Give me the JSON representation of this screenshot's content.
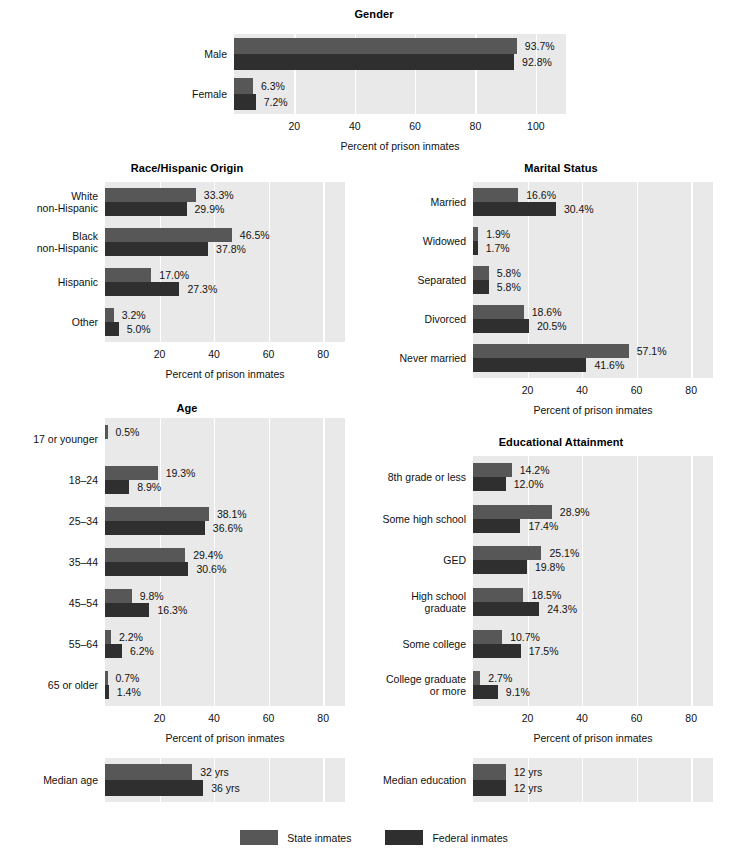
{
  "figure": {
    "bar_colors": {
      "state": "#575757",
      "federal": "#2f2f2f"
    },
    "plot_background": "#e9e9e9",
    "gridline_color": "#ffffff",
    "axis_title": "Percent of prison inmates"
  },
  "legend": {
    "items": [
      {
        "label": "State inmates",
        "color": "#575757",
        "key": "state"
      },
      {
        "label": "Federal inmates",
        "color": "#2f2f2f",
        "key": "federal"
      }
    ]
  },
  "chart_data": [
    {
      "id": "gender",
      "type": "bar",
      "orientation": "horizontal",
      "title": "Gender",
      "xlabel": "Percent of prison inmates",
      "ylabel": "",
      "xlim": [
        0,
        110
      ],
      "ticks": [
        20,
        40,
        60,
        80,
        100
      ],
      "tick_labels": [
        "20",
        "40",
        "60",
        "80",
        "100"
      ],
      "grid": true,
      "legend_position": "figure-bottom-center",
      "categories": [
        "Male",
        "Female"
      ],
      "series": [
        {
          "name": "State inmates",
          "values": [
            93.7,
            6.3
          ],
          "labels": [
            "93.7%",
            "6.3%"
          ]
        },
        {
          "name": "Federal inmates",
          "values": [
            92.8,
            7.2
          ],
          "labels": [
            "92.8%",
            "7.2%"
          ]
        }
      ]
    },
    {
      "id": "race",
      "type": "bar",
      "orientation": "horizontal",
      "title": "Race/Hispanic Origin",
      "xlabel": "Percent of prison inmates",
      "ylabel": "",
      "xlim": [
        0,
        88
      ],
      "ticks": [
        20,
        40,
        60,
        80
      ],
      "tick_labels": [
        "20",
        "40",
        "60",
        "80"
      ],
      "grid": true,
      "categories": [
        "White\nnon-Hispanic",
        "Black\nnon-Hispanic",
        "Hispanic",
        "Other"
      ],
      "series": [
        {
          "name": "State inmates",
          "values": [
            33.3,
            46.5,
            17.0,
            3.2
          ],
          "labels": [
            "33.3%",
            "46.5%",
            "17.0%",
            "3.2%"
          ]
        },
        {
          "name": "Federal inmates",
          "values": [
            29.9,
            37.8,
            27.3,
            5.0
          ],
          "labels": [
            "29.9%",
            "37.8%",
            "27.3%",
            "5.0%"
          ]
        }
      ]
    },
    {
      "id": "marital",
      "type": "bar",
      "orientation": "horizontal",
      "title": "Marital Status",
      "xlabel": "Percent of prison inmates",
      "ylabel": "",
      "xlim": [
        0,
        88
      ],
      "ticks": [
        20,
        40,
        60,
        80
      ],
      "tick_labels": [
        "20",
        "40",
        "60",
        "80"
      ],
      "grid": true,
      "categories": [
        "Married",
        "Widowed",
        "Separated",
        "Divorced",
        "Never married"
      ],
      "series": [
        {
          "name": "State inmates",
          "values": [
            16.6,
            1.9,
            5.8,
            18.6,
            57.1
          ],
          "labels": [
            "16.6%",
            "1.9%",
            "5.8%",
            "18.6%",
            "57.1%"
          ]
        },
        {
          "name": "Federal inmates",
          "values": [
            30.4,
            1.7,
            5.8,
            20.5,
            41.6
          ],
          "labels": [
            "30.4%",
            "1.7%",
            "5.8%",
            "20.5%",
            "41.6%"
          ]
        }
      ]
    },
    {
      "id": "age",
      "type": "bar",
      "orientation": "horizontal",
      "title": "Age",
      "xlabel": "Percent of prison inmates",
      "ylabel": "",
      "xlim": [
        0,
        88
      ],
      "ticks": [
        20,
        40,
        60,
        80
      ],
      "tick_labels": [
        "20",
        "40",
        "60",
        "80"
      ],
      "grid": true,
      "categories": [
        "17 or younger",
        "18–24",
        "25–34",
        "35–44",
        "45–54",
        "55–64",
        "65 or older"
      ],
      "series": [
        {
          "name": "State inmates",
          "values": [
            0.5,
            19.3,
            38.1,
            29.4,
            9.8,
            2.2,
            0.7
          ],
          "labels": [
            "0.5%",
            "19.3%",
            "38.1%",
            "29.4%",
            "9.8%",
            "2.2%",
            "0.7%"
          ]
        },
        {
          "name": "Federal inmates",
          "values": [
            null,
            8.9,
            36.6,
            30.6,
            16.3,
            6.2,
            1.4
          ],
          "labels": [
            null,
            "8.9%",
            "36.6%",
            "30.6%",
            "16.3%",
            "6.2%",
            "1.4%"
          ]
        }
      ]
    },
    {
      "id": "education",
      "type": "bar",
      "orientation": "horizontal",
      "title": "Educational Attainment",
      "xlabel": "Percent of prison inmates",
      "ylabel": "",
      "xlim": [
        0,
        88
      ],
      "ticks": [
        20,
        40,
        60,
        80
      ],
      "tick_labels": [
        "20",
        "40",
        "60",
        "80"
      ],
      "grid": true,
      "categories": [
        "8th grade or less",
        "Some high school",
        "GED",
        "High school\ngraduate",
        "Some college",
        "College graduate\nor more"
      ],
      "series": [
        {
          "name": "State inmates",
          "values": [
            14.2,
            28.9,
            25.1,
            18.5,
            10.7,
            2.7
          ],
          "labels": [
            "14.2%",
            "28.9%",
            "25.1%",
            "18.5%",
            "10.7%",
            "2.7%"
          ]
        },
        {
          "name": "Federal inmates",
          "values": [
            12.0,
            17.4,
            19.8,
            24.3,
            17.5,
            9.1
          ],
          "labels": [
            "12.0%",
            "17.4%",
            "19.8%",
            "24.3%",
            "17.5%",
            "9.1%"
          ]
        }
      ]
    },
    {
      "id": "median_age",
      "type": "bar",
      "orientation": "horizontal",
      "title": "",
      "xlabel": "",
      "xlim": [
        0,
        88
      ],
      "ticks": [
        20,
        40,
        60,
        80
      ],
      "grid": true,
      "categories": [
        "Median age"
      ],
      "series": [
        {
          "name": "State inmates",
          "values": [
            32
          ],
          "labels": [
            "32 yrs"
          ]
        },
        {
          "name": "Federal inmates",
          "values": [
            36
          ],
          "labels": [
            "36 yrs"
          ]
        }
      ]
    },
    {
      "id": "median_education",
      "type": "bar",
      "orientation": "horizontal",
      "title": "",
      "xlabel": "",
      "xlim": [
        0,
        88
      ],
      "ticks": [
        20,
        40,
        60,
        80
      ],
      "grid": true,
      "categories": [
        "Median education"
      ],
      "series": [
        {
          "name": "State inmates",
          "values": [
            12
          ],
          "labels": [
            "12 yrs"
          ]
        },
        {
          "name": "Federal inmates",
          "values": [
            12
          ],
          "labels": [
            "12 yrs"
          ]
        }
      ]
    }
  ]
}
